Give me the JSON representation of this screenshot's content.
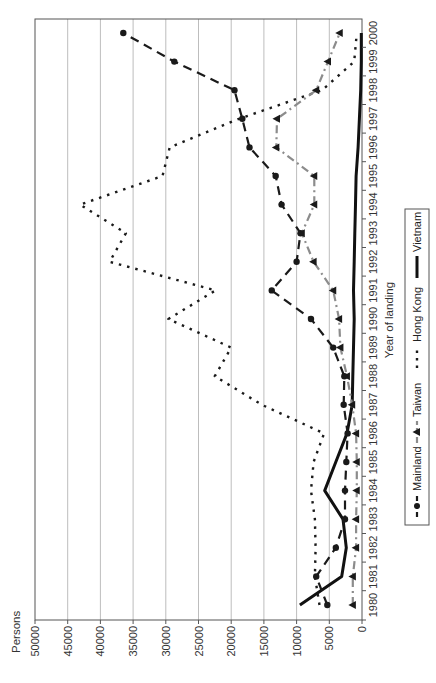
{
  "chart_data": {
    "type": "line",
    "orientation_note": "figure rotated 90 degrees counter-clockwise on page",
    "title": "",
    "xlabel": "Year of landing",
    "ylabel": "Persons",
    "ylim": [
      0,
      50000
    ],
    "yticks": [
      "0",
      "5000",
      "10000",
      "15000",
      "20000",
      "25000",
      "30000",
      "35000",
      "40000",
      "45000",
      "50000"
    ],
    "grid": true,
    "legend_position": "bottom",
    "x": [
      "1980",
      "1981",
      "1982",
      "1983",
      "1984",
      "1985",
      "1986",
      "1987",
      "1988",
      "1989",
      "1990",
      "1991",
      "1992",
      "1993",
      "1994",
      "1995",
      "1996",
      "1997",
      "1998",
      "1999",
      "2000"
    ],
    "series": [
      {
        "name": "Mainland",
        "style": "long-dash with circle markers",
        "color": "#1a1a1a",
        "values": [
          5300,
          7000,
          4000,
          2600,
          2600,
          2400,
          2200,
          2800,
          2700,
          4400,
          7800,
          13800,
          10000,
          9400,
          12300,
          13200,
          17200,
          18300,
          19500,
          28700,
          36500
        ]
      },
      {
        "name": "Taiwan",
        "style": "grey dash-dot with triangle markers",
        "color": "#8c8c8c",
        "values": [
          1400,
          1400,
          900,
          900,
          800,
          800,
          900,
          1500,
          2300,
          3300,
          3500,
          4400,
          7400,
          9200,
          7300,
          7300,
          13100,
          13000,
          7000,
          5200,
          3400
        ]
      },
      {
        "name": "Hong Kong",
        "style": "dotted",
        "color": "#1a1a1a",
        "values": [
          6500,
          7200,
          7100,
          7200,
          7800,
          7400,
          5800,
          15300,
          22500,
          20000,
          29600,
          22400,
          38600,
          36100,
          43100,
          30500,
          29400,
          18800,
          6100,
          1200,
          800
        ]
      },
      {
        "name": "Vietnam",
        "style": "solid thick",
        "color": "#111111",
        "values": [
          9500,
          3100,
          2400,
          2900,
          5700,
          4000,
          2300,
          1500,
          1400,
          1300,
          1200,
          1300,
          1200,
          1100,
          1000,
          900,
          600,
          400,
          200,
          100,
          100
        ]
      }
    ]
  },
  "labels": {
    "ylabel": "Persons",
    "xlabel": "Year of landing"
  },
  "legend": {
    "mainland": "Mainland",
    "taiwan": "Taiwan",
    "hongkong": "Hong Kong",
    "vietnam": "Vietnam"
  }
}
